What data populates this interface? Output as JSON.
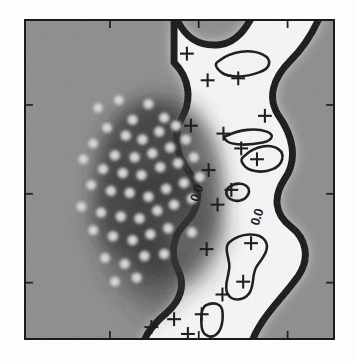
{
  "figure": {
    "kind": "grayscale-density-contour-map",
    "background_color": "#ffffff",
    "field_color": "#8b8b8b",
    "frame_color": "#1b1b1b",
    "contour_color": "#121212",
    "marker_color": "#111111",
    "point_fill": "#d8d8d8",
    "cloud_color": "#2a2a2a",
    "ridge_color": "#f2f2f2"
  },
  "axes": {
    "frame": {
      "x": 24,
      "y": 19,
      "width": 311,
      "height": 321
    },
    "tick_direction": "in",
    "tick_length": 7,
    "tick_color": "#151515",
    "ticks_top": [
      85,
      175,
      265
    ],
    "ticks_bottom": [
      85,
      175,
      265
    ],
    "ticks_left": [
      85,
      175,
      265
    ],
    "ticks_right": [
      85,
      175,
      265
    ],
    "tick_labels": []
  },
  "chart_data": {
    "type": "heatmap",
    "title": "",
    "xlabel": "",
    "ylabel": "",
    "grid": false,
    "legend": "none",
    "contour_labels": [
      {
        "text": "0.0",
        "x": 205,
        "y": 188,
        "rotation": -72
      },
      {
        "text": "0.0",
        "x": 266,
        "y": 212,
        "rotation": -72
      }
    ],
    "scatter_points": [
      [
        101,
        100
      ],
      [
        122,
        92
      ],
      [
        136,
        112
      ],
      [
        152,
        96
      ],
      [
        168,
        110
      ],
      [
        110,
        120
      ],
      [
        129,
        128
      ],
      [
        146,
        132
      ],
      [
        163,
        124
      ],
      [
        180,
        118
      ],
      [
        96,
        136
      ],
      [
        118,
        148
      ],
      [
        138,
        150
      ],
      [
        156,
        146
      ],
      [
        174,
        140
      ],
      [
        190,
        132
      ],
      [
        86,
        152
      ],
      [
        106,
        162
      ],
      [
        126,
        166
      ],
      [
        145,
        168
      ],
      [
        164,
        160
      ],
      [
        182,
        156
      ],
      [
        198,
        150
      ],
      [
        94,
        178
      ],
      [
        114,
        184
      ],
      [
        133,
        186
      ],
      [
        152,
        190
      ],
      [
        170,
        182
      ],
      [
        188,
        176
      ],
      [
        204,
        170
      ],
      [
        84,
        200
      ],
      [
        104,
        206
      ],
      [
        124,
        210
      ],
      [
        143,
        212
      ],
      [
        161,
        204
      ],
      [
        178,
        198
      ],
      [
        196,
        192
      ],
      [
        96,
        224
      ],
      [
        116,
        230
      ],
      [
        136,
        234
      ],
      [
        154,
        228
      ],
      [
        172,
        222
      ],
      [
        108,
        252
      ],
      [
        128,
        258
      ],
      [
        148,
        250
      ],
      [
        118,
        276
      ],
      [
        140,
        272
      ],
      [
        196,
        226
      ],
      [
        168,
        248
      ]
    ],
    "cross_markers": [
      [
        191,
        45
      ],
      [
        212,
        72
      ],
      [
        243,
        70
      ],
      [
        195,
        118
      ],
      [
        228,
        126
      ],
      [
        213,
        163
      ],
      [
        246,
        141
      ],
      [
        262,
        152
      ],
      [
        236,
        183
      ],
      [
        222,
        198
      ],
      [
        211,
        243
      ],
      [
        256,
        237
      ],
      [
        248,
        276
      ],
      [
        227,
        289
      ],
      [
        206,
        309
      ],
      [
        178,
        314
      ],
      [
        155,
        322
      ],
      [
        192,
        329
      ],
      [
        270,
        108
      ]
    ],
    "ridge_band_description": "bright sinuous vertical band bounded by thick dark contour lines running top to bottom on the right half",
    "cloud_description": "dark diffuse density cloud occupying the left-centre with light circular scatter markers overlaid"
  }
}
